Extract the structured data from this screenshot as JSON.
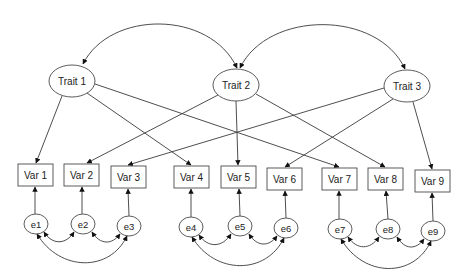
{
  "diagram": {
    "type": "structural-equation-model",
    "colors": {
      "stroke": "#3a3a3a",
      "node_border": "#4a4a4a",
      "text": "#222222",
      "background": "#ffffff"
    },
    "traits": [
      {
        "id": "t1",
        "label": "Trait 1",
        "cx": 72,
        "cy": 81,
        "rx": 23,
        "ry": 16
      },
      {
        "id": "t2",
        "label": "Trait 2",
        "cx": 236,
        "cy": 85,
        "rx": 23,
        "ry": 16
      },
      {
        "id": "t3",
        "label": "Trait 3",
        "cx": 407,
        "cy": 86,
        "rx": 23,
        "ry": 16
      }
    ],
    "variables": [
      {
        "id": "v1",
        "label": "Var 1",
        "x": 18,
        "y": 164,
        "w": 35,
        "h": 22
      },
      {
        "id": "v2",
        "label": "Var 2",
        "x": 64,
        "y": 164,
        "w": 35,
        "h": 22
      },
      {
        "id": "v3",
        "label": "Var 3",
        "x": 111,
        "y": 166,
        "w": 35,
        "h": 22
      },
      {
        "id": "v4",
        "label": "Var 4",
        "x": 174,
        "y": 166,
        "w": 35,
        "h": 22
      },
      {
        "id": "v5",
        "label": "Var 5",
        "x": 221,
        "y": 166,
        "w": 35,
        "h": 22
      },
      {
        "id": "v6",
        "label": "Var 6",
        "x": 267,
        "y": 168,
        "w": 35,
        "h": 22
      },
      {
        "id": "v7",
        "label": "Var 7",
        "x": 322,
        "y": 168,
        "w": 35,
        "h": 22
      },
      {
        "id": "v8",
        "label": "Var 8",
        "x": 368,
        "y": 168,
        "w": 35,
        "h": 22
      },
      {
        "id": "v9",
        "label": "Var 9",
        "x": 415,
        "y": 170,
        "w": 35,
        "h": 22
      }
    ],
    "errors": [
      {
        "id": "e1",
        "label": "e1",
        "cx": 36,
        "cy": 224,
        "rx": 12,
        "ry": 10
      },
      {
        "id": "e2",
        "label": "e2",
        "cx": 83,
        "cy": 224,
        "rx": 12,
        "ry": 10
      },
      {
        "id": "e3",
        "label": "e3",
        "cx": 129,
        "cy": 226,
        "rx": 12,
        "ry": 10
      },
      {
        "id": "e4",
        "label": "e4",
        "cx": 191,
        "cy": 227,
        "rx": 12,
        "ry": 10
      },
      {
        "id": "e5",
        "label": "e5",
        "cx": 240,
        "cy": 226,
        "rx": 12,
        "ry": 10
      },
      {
        "id": "e6",
        "label": "e6",
        "cx": 286,
        "cy": 228,
        "rx": 12,
        "ry": 10
      },
      {
        "id": "e7",
        "label": "e7",
        "cx": 340,
        "cy": 229,
        "rx": 12,
        "ry": 10
      },
      {
        "id": "e8",
        "label": "e8",
        "cx": 388,
        "cy": 229,
        "rx": 12,
        "ry": 10
      },
      {
        "id": "e9",
        "label": "e9",
        "cx": 433,
        "cy": 231,
        "rx": 12,
        "ry": 10
      }
    ],
    "loadings": [
      {
        "from": "Trait 1",
        "to": "Var 1"
      },
      {
        "from": "Trait 1",
        "to": "Var 4"
      },
      {
        "from": "Trait 1",
        "to": "Var 7"
      },
      {
        "from": "Trait 2",
        "to": "Var 2"
      },
      {
        "from": "Trait 2",
        "to": "Var 5"
      },
      {
        "from": "Trait 2",
        "to": "Var 8"
      },
      {
        "from": "Trait 3",
        "to": "Var 3"
      },
      {
        "from": "Trait 3",
        "to": "Var 6"
      },
      {
        "from": "Trait 3",
        "to": "Var 9"
      }
    ],
    "trait_covariances": [
      {
        "between": [
          "Trait 1",
          "Trait 2"
        ]
      },
      {
        "between": [
          "Trait 2",
          "Trait 3"
        ]
      }
    ],
    "error_paths": [
      {
        "from": "e1",
        "to": "Var 1"
      },
      {
        "from": "e2",
        "to": "Var 2"
      },
      {
        "from": "e3",
        "to": "Var 3"
      },
      {
        "from": "e4",
        "to": "Var 4"
      },
      {
        "from": "e5",
        "to": "Var 5"
      },
      {
        "from": "e6",
        "to": "Var 6"
      },
      {
        "from": "e7",
        "to": "Var 7"
      },
      {
        "from": "e8",
        "to": "Var 8"
      },
      {
        "from": "e9",
        "to": "Var 9"
      }
    ],
    "error_covariances": [
      {
        "between": [
          "e1",
          "e2"
        ]
      },
      {
        "between": [
          "e2",
          "e3"
        ]
      },
      {
        "between": [
          "e1",
          "e3"
        ]
      },
      {
        "between": [
          "e4",
          "e5"
        ]
      },
      {
        "between": [
          "e5",
          "e6"
        ]
      },
      {
        "between": [
          "e4",
          "e6"
        ]
      },
      {
        "between": [
          "e7",
          "e8"
        ]
      },
      {
        "between": [
          "e8",
          "e9"
        ]
      },
      {
        "between": [
          "e7",
          "e9"
        ]
      }
    ]
  }
}
